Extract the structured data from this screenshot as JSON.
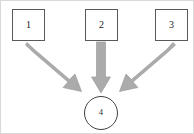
{
  "diagram": {
    "type": "convergence-flow-diagram",
    "canvas": {
      "width": 194,
      "height": 134,
      "background": "#ffffff",
      "border_color": "#d9d9d9"
    },
    "palette": {
      "arrow_fill": "#ababab",
      "arrow_stroke": "#9a9a9a",
      "box_border": "#595959",
      "circle_border": "#404040",
      "label_color": "#1a1a1a"
    },
    "nodes": [
      {
        "id": "box-1",
        "shape": "square",
        "label": "1",
        "x": 11,
        "y": 8,
        "width": 33,
        "height": 32
      },
      {
        "id": "box-2",
        "shape": "square",
        "label": "2",
        "x": 84,
        "y": 8,
        "width": 33,
        "height": 32
      },
      {
        "id": "box-3",
        "shape": "square",
        "label": "3",
        "x": 154,
        "y": 8,
        "width": 33,
        "height": 32
      },
      {
        "id": "circle-4",
        "shape": "circle",
        "label": "4",
        "x": 83,
        "y": 95,
        "width": 34,
        "height": 34
      }
    ],
    "arrows": [
      {
        "id": "arrow-1-to-4",
        "from": "box-1",
        "to": "circle-4",
        "direction": "diagonal-down-right",
        "start": [
          28,
          46
        ],
        "end": [
          78,
          89
        ]
      },
      {
        "id": "arrow-2-to-4",
        "from": "box-2",
        "to": "circle-4",
        "direction": "down",
        "start": [
          100,
          45
        ],
        "end": [
          100,
          91
        ]
      },
      {
        "id": "arrow-3-to-4",
        "from": "box-3",
        "to": "circle-4",
        "direction": "diagonal-down-left",
        "start": [
          170,
          46
        ],
        "end": [
          121,
          90
        ]
      }
    ]
  }
}
